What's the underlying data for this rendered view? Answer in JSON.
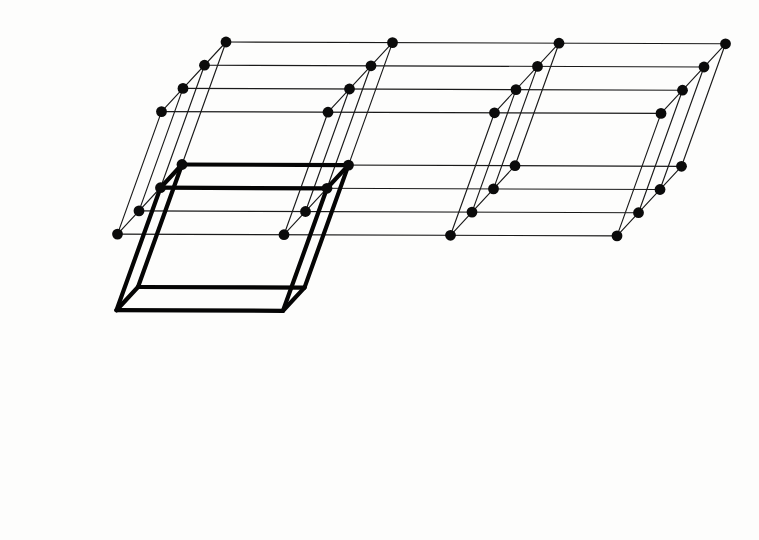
{
  "figure": {
    "type": "3d-lattice",
    "background_color": "#fdfdfc",
    "node_color": "#0b0b0b",
    "edge_color": "#1a1a1a",
    "cell_highlight_color": "#050505",
    "node_radius": 5.4,
    "thin_edge_width": 1.15,
    "cell_edge_width": 4.2
  },
  "lattice": {
    "description": "Triclinic/oblique point lattice drawn in parallel (oblique) projection",
    "origin": {
      "x": 226,
      "y": 42
    },
    "counts": {
      "a": 4,
      "b": 4,
      "c": 2
    },
    "basis_vectors": {
      "a": {
        "x": 166.5,
        "y": 0.6,
        "label": "a"
      },
      "b": {
        "x": -21.5,
        "y": 23.2,
        "label": "b"
      },
      "c": {
        "x": -44.0,
        "y": 122.5,
        "label": "c"
      }
    },
    "total_nodes": 32
  },
  "unit_cell": {
    "label": "unit cell",
    "origin_index": {
      "a": 0,
      "b": 0,
      "c": 1
    },
    "spans": {
      "a": 1,
      "b": 1,
      "c": 1
    },
    "emphasis": "bold"
  },
  "chart_data": {
    "type": "scatter",
    "xlabel": "",
    "ylabel": "",
    "grid": true,
    "legend": "none",
    "series": [
      {
        "name": "lattice points",
        "points": [
          [
            226,
            42
          ],
          [
            204.5,
            65.2
          ],
          [
            183,
            88.4
          ],
          [
            161.5,
            111.6
          ],
          [
            392.5,
            42.6
          ],
          [
            371,
            65.8
          ],
          [
            349.5,
            89
          ],
          [
            328,
            112.2
          ],
          [
            559,
            43.2
          ],
          [
            537.5,
            66.4
          ],
          [
            516,
            89.6
          ],
          [
            494.5,
            112.8
          ],
          [
            725.5,
            43.8
          ],
          [
            704,
            67
          ],
          [
            682.5,
            90.2
          ],
          [
            661,
            113.4
          ],
          [
            182,
            164.5
          ],
          [
            160.5,
            187.7
          ],
          [
            139,
            210.9
          ],
          [
            117.5,
            234.1
          ],
          [
            348.5,
            165.1
          ],
          [
            327,
            188.3
          ],
          [
            305.5,
            211.5
          ],
          [
            284,
            234.7
          ],
          [
            515,
            165.7
          ],
          [
            493.5,
            188.9
          ],
          [
            472,
            212.1
          ],
          [
            450.5,
            235.3
          ],
          [
            681.5,
            166.3
          ],
          [
            660,
            189.5
          ],
          [
            638.5,
            212.7
          ],
          [
            617,
            235.9
          ]
        ]
      }
    ]
  }
}
